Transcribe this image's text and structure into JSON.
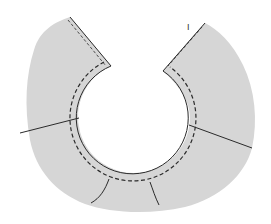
{
  "diagram": {
    "type": "sewing-pattern-collar-piece",
    "colors": {
      "background": "#ffffff",
      "fabric_fill": "#d6d6d6",
      "outline": "#2a2a2a",
      "stitch": "#2a2a2a"
    },
    "labels": {
      "corner_mark": "I"
    },
    "elements": [
      "collar-fabric-shape",
      "neckline-cutout",
      "neckline-stitch-line",
      "left-opening-edge",
      "right-opening-edge",
      "left-seam-line",
      "right-seam-line",
      "bottom-left-dart-line",
      "bottom-right-dart-line"
    ]
  }
}
